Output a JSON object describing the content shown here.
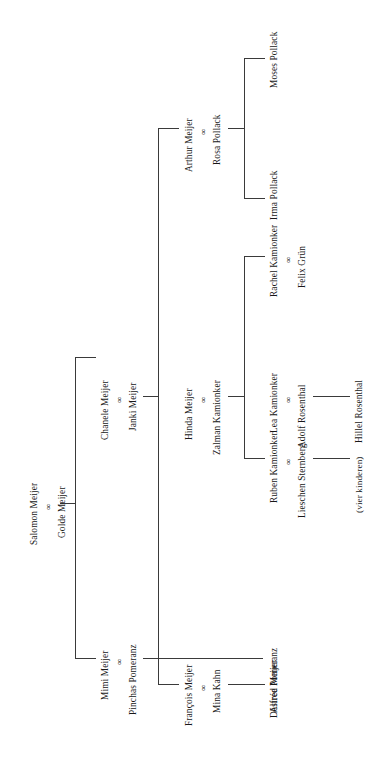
{
  "diagram": {
    "kind": "family-tree",
    "orientation": "rotated-90-ccw",
    "line_color": "#3a3a3a",
    "background_color": "#ffffff",
    "marriage_symbol": "∞"
  },
  "people": {
    "salomon_meijer": "Salomon Meijer",
    "golde_meijer": "Golde Meijer",
    "chanele_meijer": "Chanele Meijer",
    "janki_meijer": "Janki Meijer",
    "mimi_meijer": "Mimi Meijer",
    "pinchas_pomeranz": "Pinchas Pomeranz",
    "arthur_meijer": "Arthur Meijer",
    "rosa_pollack": "Rosa Pollack",
    "hinda_meijer": "Hinda Meijer",
    "zalman_kamionker": "Zalman Kamionker",
    "francois_meijer": "François Meijer",
    "mina_kahn": "Mina Kahn",
    "desiree_pomeranz": "Désirée Pomeranz",
    "irma_pollack": "Irma Pollack",
    "moses_pollack": "Moses Pollack",
    "rachel_kamionker": "Rachel Kamionker",
    "felix_gruen": "Felix Grün",
    "lea_kamionker": "Lea Kamionker",
    "adolf_rosenthal": "Adolf Rosenthal",
    "hillel_rosenthal": "Hillel Rosenthal",
    "ruben_kamionker": "Ruben Kamionker",
    "lieschen_sternberg": "Lieschen Sternberg",
    "vier_kinderen": "(vier kinderen)",
    "alfred_meijer": "Alfred Meijer"
  },
  "marriage_symbols": {
    "salomon_golde": "∞",
    "chanele_janki": "∞",
    "mimi_pinchas": "∞",
    "arthur_rosa": "∞",
    "hinda_zalman": "∞",
    "francois_mina": "∞",
    "rachel_felix": "∞",
    "lea_adolf": "∞",
    "ruben_lieschen": "∞"
  },
  "couples": [
    {
      "id": "salomon_golde",
      "husband": "Salomon Meijer",
      "wife": "Golde Meijer",
      "generation": 1
    },
    {
      "id": "chanele_janki",
      "husband": "Janki Meijer",
      "wife": "Chanele Meijer",
      "generation": 2
    },
    {
      "id": "mimi_pinchas",
      "husband": "Pinchas Pomeranz",
      "wife": "Mimi Meijer",
      "generation": 2
    },
    {
      "id": "arthur_rosa",
      "husband": "Arthur Meijer",
      "wife": "Rosa Pollack",
      "generation": 3
    },
    {
      "id": "hinda_zalman",
      "husband": "Zalman Kamionker",
      "wife": "Hinda Meijer",
      "generation": 3
    },
    {
      "id": "francois_mina",
      "husband": "François Meijer",
      "wife": "Mina Kahn",
      "generation": 3
    },
    {
      "id": "rachel_felix",
      "husband": "Felix Grün",
      "wife": "Rachel Kamionker",
      "generation": 4
    },
    {
      "id": "lea_adolf",
      "husband": "Adolf Rosenthal",
      "wife": "Lea Kamionker",
      "generation": 4
    },
    {
      "id": "ruben_lieschen",
      "husband": "Ruben Kamionker",
      "wife": "Lieschen Sternberg",
      "generation": 4
    }
  ],
  "singles": [
    {
      "name": "Désirée Pomeranz",
      "generation": 3
    },
    {
      "name": "Irma Pollack",
      "generation": 4
    },
    {
      "name": "Moses Pollack",
      "generation": 4
    },
    {
      "name": "Hillel Rosenthal",
      "generation": 5
    },
    {
      "name": "Alfred Meijer",
      "generation": 4
    },
    {
      "name": "(vier kinderen)",
      "generation": 5
    }
  ],
  "relations": [
    {
      "parents": "salomon_golde",
      "children": [
        "chanele_janki",
        "mimi_pinchas"
      ]
    },
    {
      "parents": "chanele_janki",
      "children": [
        "arthur_rosa",
        "hinda_zalman",
        "francois_mina"
      ]
    },
    {
      "parents": "mimi_pinchas",
      "children": [
        "Désirée Pomeranz"
      ]
    },
    {
      "parents": "arthur_rosa",
      "children": [
        "Irma Pollack",
        "Moses Pollack"
      ]
    },
    {
      "parents": "hinda_zalman",
      "children": [
        "rachel_felix",
        "lea_kamionker",
        "ruben_lieschen"
      ]
    },
    {
      "parents": "francois_mina",
      "children": [
        "Alfred Meijer"
      ]
    },
    {
      "parents": "lea_adolf",
      "children": [
        "Hillel Rosenthal"
      ]
    },
    {
      "parents": "ruben_lieschen",
      "children": [
        "(vier kinderen)"
      ]
    }
  ]
}
